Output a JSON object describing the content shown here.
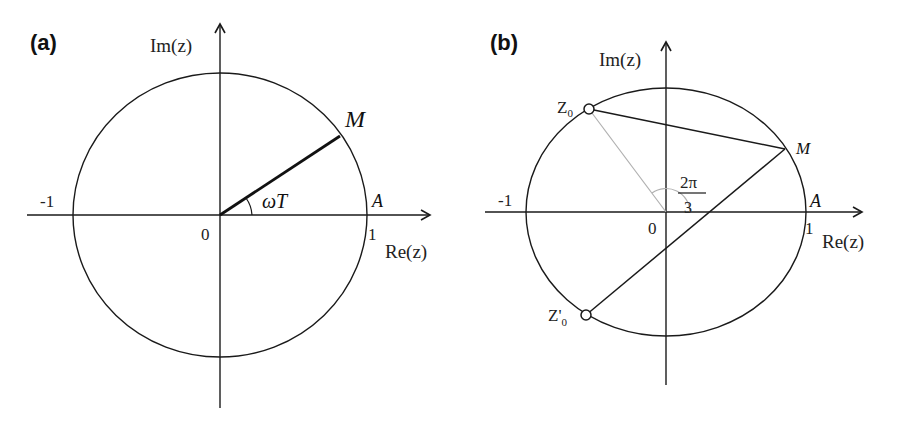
{
  "panels": [
    {
      "id": "a",
      "label": "(a)",
      "y_axis_label": "Im(z)",
      "x_axis_label": "Re(z)",
      "ticks": {
        "neg_one": "-1",
        "origin": "0",
        "one": "1"
      },
      "points": {
        "M": "M",
        "A": "A"
      },
      "angle_label": "ωT"
    },
    {
      "id": "b",
      "label": "(b)",
      "y_axis_label": "Im(z)",
      "x_axis_label": "Re(z)",
      "ticks": {
        "neg_one": "-1",
        "origin": "0",
        "one": "1"
      },
      "points": {
        "M": "M",
        "A": "A",
        "Z0": "Z",
        "Z0_sub": "0",
        "Z0p": "Z'",
        "Z0p_sub": "0"
      },
      "angle_label_num": "2π",
      "angle_label_den": "3"
    }
  ],
  "colors": {
    "line": "#1a1a1a",
    "light_line": "#b0b0b0",
    "background": "#ffffff"
  }
}
